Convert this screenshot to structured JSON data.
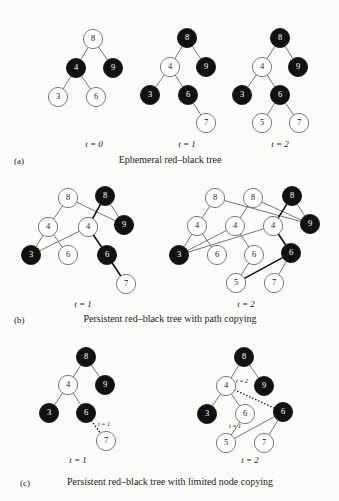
{
  "figure": {
    "node_radius": 9.6,
    "colors": {
      "black_node": "#111111",
      "white_node": "#ffffff",
      "edge": "#5e5e5e",
      "background": "#fbfbf9",
      "text": "#1b1b1b"
    }
  },
  "panels": [
    {
      "letter": "(a)",
      "caption": "Ephemeral red–black tree",
      "caption_x": 170,
      "caption_y": 163,
      "letter_x": 14,
      "letter_y": 164,
      "trees": [
        {
          "time_label": "t = 0",
          "label_x": 94,
          "label_y": 147,
          "nodes": [
            {
              "id": "n8",
              "value": "8",
              "color": "white",
              "x": 93,
              "y": 39
            },
            {
              "id": "n4",
              "value": "4",
              "color": "black",
              "x": 76,
              "y": 68
            },
            {
              "id": "n9",
              "value": "9",
              "color": "black",
              "x": 113,
              "y": 68
            },
            {
              "id": "n3",
              "value": "3",
              "color": "white",
              "x": 58,
              "y": 97
            },
            {
              "id": "n6",
              "value": "6",
              "color": "white",
              "x": 96,
              "y": 97
            }
          ],
          "edges": [
            {
              "from": "n8",
              "to": "n4",
              "style": "plain"
            },
            {
              "from": "n8",
              "to": "n9",
              "style": "plain"
            },
            {
              "from": "n4",
              "to": "n3",
              "style": "plain"
            },
            {
              "from": "n4",
              "to": "n6",
              "style": "plain"
            }
          ],
          "annotations": []
        },
        {
          "time_label": "t = 1",
          "label_x": 187,
          "label_y": 147,
          "nodes": [
            {
              "id": "n8",
              "value": "8",
              "color": "black",
              "x": 187,
              "y": 38
            },
            {
              "id": "n4",
              "value": "4",
              "color": "white",
              "x": 170,
              "y": 67
            },
            {
              "id": "n9",
              "value": "9",
              "color": "black",
              "x": 206,
              "y": 67
            },
            {
              "id": "n3",
              "value": "3",
              "color": "black",
              "x": 150,
              "y": 95
            },
            {
              "id": "n6",
              "value": "6",
              "color": "black",
              "x": 188,
              "y": 95
            },
            {
              "id": "n7",
              "value": "7",
              "color": "white",
              "x": 206,
              "y": 123
            }
          ],
          "edges": [
            {
              "from": "n8",
              "to": "n4",
              "style": "plain"
            },
            {
              "from": "n8",
              "to": "n9",
              "style": "plain"
            },
            {
              "from": "n4",
              "to": "n3",
              "style": "plain"
            },
            {
              "from": "n4",
              "to": "n6",
              "style": "plain"
            },
            {
              "from": "n6",
              "to": "n7",
              "style": "plain"
            }
          ],
          "annotations": []
        },
        {
          "time_label": "t = 2",
          "label_x": 280,
          "label_y": 147,
          "nodes": [
            {
              "id": "n8",
              "value": "8",
              "color": "black",
              "x": 280,
              "y": 38
            },
            {
              "id": "n4",
              "value": "4",
              "color": "white",
              "x": 262,
              "y": 67
            },
            {
              "id": "n9",
              "value": "9",
              "color": "black",
              "x": 298,
              "y": 67
            },
            {
              "id": "n3",
              "value": "3",
              "color": "black",
              "x": 242,
              "y": 95
            },
            {
              "id": "n6",
              "value": "6",
              "color": "black",
              "x": 280,
              "y": 95
            },
            {
              "id": "n5",
              "value": "5",
              "color": "white",
              "x": 262,
              "y": 123
            },
            {
              "id": "n7",
              "value": "7",
              "color": "white",
              "x": 299,
              "y": 123
            }
          ],
          "edges": [
            {
              "from": "n8",
              "to": "n4",
              "style": "plain"
            },
            {
              "from": "n8",
              "to": "n9",
              "style": "plain"
            },
            {
              "from": "n4",
              "to": "n3",
              "style": "plain"
            },
            {
              "from": "n4",
              "to": "n6",
              "style": "plain"
            },
            {
              "from": "n6",
              "to": "n5",
              "style": "plain"
            },
            {
              "from": "n6",
              "to": "n7",
              "style": "plain"
            }
          ],
          "annotations": []
        }
      ]
    },
    {
      "letter": "(b)",
      "caption": "Persistent red–black tree with path copying",
      "caption_x": 170,
      "caption_y": 322,
      "letter_x": 14,
      "letter_y": 323,
      "trees": [
        {
          "time_label": "t = 1",
          "label_x": 83,
          "label_y": 307,
          "nodes": [
            {
              "id": "a8",
              "value": "8",
              "color": "white",
              "x": 68,
              "y": 198
            },
            {
              "id": "b8",
              "value": "8",
              "color": "black",
              "x": 105,
              "y": 196
            },
            {
              "id": "a4",
              "value": "4",
              "color": "white",
              "x": 48,
              "y": 227
            },
            {
              "id": "b4",
              "value": "4",
              "color": "white",
              "x": 88,
              "y": 227
            },
            {
              "id": "n9",
              "value": "9",
              "color": "black",
              "x": 124,
              "y": 225
            },
            {
              "id": "n3",
              "value": "3",
              "color": "black",
              "x": 31,
              "y": 255
            },
            {
              "id": "a6",
              "value": "6",
              "color": "white",
              "x": 68,
              "y": 255
            },
            {
              "id": "b6",
              "value": "6",
              "color": "black",
              "x": 107,
              "y": 255
            },
            {
              "id": "n7",
              "value": "7",
              "color": "white",
              "x": 126,
              "y": 284
            }
          ],
          "edges": [
            {
              "from": "a8",
              "to": "a4",
              "style": "plain"
            },
            {
              "from": "a8",
              "to": "n9",
              "style": "plain"
            },
            {
              "from": "b8",
              "to": "b4",
              "style": "thick"
            },
            {
              "from": "b8",
              "to": "n9",
              "style": "plain"
            },
            {
              "from": "a4",
              "to": "n3",
              "style": "plain"
            },
            {
              "from": "a4",
              "to": "a6",
              "style": "plain"
            },
            {
              "from": "b4",
              "to": "n3",
              "style": "plain"
            },
            {
              "from": "b4",
              "to": "b6",
              "style": "thick"
            },
            {
              "from": "b6",
              "to": "n7",
              "style": "thick"
            }
          ],
          "annotations": []
        },
        {
          "time_label": "t = 2",
          "label_x": 246,
          "label_y": 307,
          "nodes": [
            {
              "id": "a8",
              "value": "8",
              "color": "white",
              "x": 215,
              "y": 198
            },
            {
              "id": "b8",
              "value": "8",
              "color": "white",
              "x": 253,
              "y": 198
            },
            {
              "id": "c8",
              "value": "8",
              "color": "black",
              "x": 292,
              "y": 196
            },
            {
              "id": "a4",
              "value": "4",
              "color": "white",
              "x": 197,
              "y": 226
            },
            {
              "id": "b4",
              "value": "4",
              "color": "white",
              "x": 235,
              "y": 226
            },
            {
              "id": "c4",
              "value": "4",
              "color": "white",
              "x": 273,
              "y": 226
            },
            {
              "id": "n9",
              "value": "9",
              "color": "black",
              "x": 310,
              "y": 224
            },
            {
              "id": "n3",
              "value": "3",
              "color": "black",
              "x": 179,
              "y": 255
            },
            {
              "id": "a6",
              "value": "6",
              "color": "white",
              "x": 217,
              "y": 255
            },
            {
              "id": "b6",
              "value": "6",
              "color": "white",
              "x": 254,
              "y": 255
            },
            {
              "id": "c6",
              "value": "6",
              "color": "black",
              "x": 291,
              "y": 253
            },
            {
              "id": "n5",
              "value": "5",
              "color": "white",
              "x": 236,
              "y": 283
            },
            {
              "id": "n7",
              "value": "7",
              "color": "white",
              "x": 274,
              "y": 283
            }
          ],
          "edges": [
            {
              "from": "a8",
              "to": "a4",
              "style": "plain"
            },
            {
              "from": "a8",
              "to": "n9",
              "style": "plain"
            },
            {
              "from": "b8",
              "to": "b4",
              "style": "plain"
            },
            {
              "from": "b8",
              "to": "n9",
              "style": "plain"
            },
            {
              "from": "c8",
              "to": "c4",
              "style": "thick"
            },
            {
              "from": "c8",
              "to": "n9",
              "style": "plain"
            },
            {
              "from": "a4",
              "to": "n3",
              "style": "plain"
            },
            {
              "from": "a4",
              "to": "a6",
              "style": "plain"
            },
            {
              "from": "b4",
              "to": "n3",
              "style": "plain"
            },
            {
              "from": "b4",
              "to": "b6",
              "style": "plain"
            },
            {
              "from": "c4",
              "to": "n3",
              "style": "plain"
            },
            {
              "from": "c4",
              "to": "c6",
              "style": "thick"
            },
            {
              "from": "b6",
              "to": "n5",
              "style": "plain"
            },
            {
              "from": "c6",
              "to": "n5",
              "style": "thick"
            },
            {
              "from": "c6",
              "to": "n7",
              "style": "plain"
            }
          ],
          "annotations": []
        }
      ]
    },
    {
      "letter": "(c)",
      "caption": "Persistent red–black tree with limited node copying",
      "caption_x": 170,
      "caption_y": 485,
      "letter_x": 20,
      "letter_y": 486,
      "trees": [
        {
          "time_label": "t = 1",
          "label_x": 78,
          "label_y": 463,
          "nodes": [
            {
              "id": "n8",
              "value": "8",
              "color": "black",
              "x": 86,
              "y": 357
            },
            {
              "id": "n4",
              "value": "4",
              "color": "white",
              "x": 68,
              "y": 385
            },
            {
              "id": "n9",
              "value": "9",
              "color": "black",
              "x": 105,
              "y": 385
            },
            {
              "id": "n3",
              "value": "3",
              "color": "black",
              "x": 49,
              "y": 413
            },
            {
              "id": "n6",
              "value": "6",
              "color": "black",
              "x": 86,
              "y": 413
            },
            {
              "id": "n7",
              "value": "7",
              "color": "white",
              "x": 106,
              "y": 441
            }
          ],
          "edges": [
            {
              "from": "n8",
              "to": "n4",
              "style": "plain"
            },
            {
              "from": "n8",
              "to": "n9",
              "style": "plain"
            },
            {
              "from": "n4",
              "to": "n3",
              "style": "plain"
            },
            {
              "from": "n4",
              "to": "n6",
              "style": "plain"
            },
            {
              "from": "n6",
              "to": "n7",
              "style": "dotted"
            }
          ],
          "annotations": [
            {
              "text": "t = 1",
              "x": 98,
              "y": 426
            }
          ]
        },
        {
          "time_label": "t = 2",
          "label_x": 250,
          "label_y": 463,
          "nodes": [
            {
              "id": "n8",
              "value": "8",
              "color": "black",
              "x": 244,
              "y": 357
            },
            {
              "id": "n4",
              "value": "4",
              "color": "white",
              "x": 226,
              "y": 386
            },
            {
              "id": "n9",
              "value": "9",
              "color": "black",
              "x": 264,
              "y": 386
            },
            {
              "id": "n3",
              "value": "3",
              "color": "black",
              "x": 207,
              "y": 414
            },
            {
              "id": "n6",
              "value": "6",
              "color": "white",
              "x": 245,
              "y": 414
            },
            {
              "id": "c6",
              "value": "6",
              "color": "black",
              "x": 283,
              "y": 412
            },
            {
              "id": "n5",
              "value": "5",
              "color": "white",
              "x": 226,
              "y": 443
            },
            {
              "id": "n7",
              "value": "7",
              "color": "white",
              "x": 264,
              "y": 443
            }
          ],
          "edges": [
            {
              "from": "n8",
              "to": "n4",
              "style": "plain"
            },
            {
              "from": "n8",
              "to": "n9",
              "style": "plain"
            },
            {
              "from": "n4",
              "to": "n3",
              "style": "plain"
            },
            {
              "from": "n4",
              "to": "n6",
              "style": "plain"
            },
            {
              "from": "n4",
              "to": "c6",
              "style": "dotted"
            },
            {
              "from": "n6",
              "to": "n5",
              "style": "plain"
            },
            {
              "from": "c6",
              "to": "n5",
              "style": "plain"
            },
            {
              "from": "c6",
              "to": "n7",
              "style": "plain"
            }
          ],
          "annotations": [
            {
              "text": "t = 2",
              "x": 236,
              "y": 383
            },
            {
              "text": "t = 1",
              "x": 229,
              "y": 428
            }
          ]
        }
      ]
    }
  ]
}
